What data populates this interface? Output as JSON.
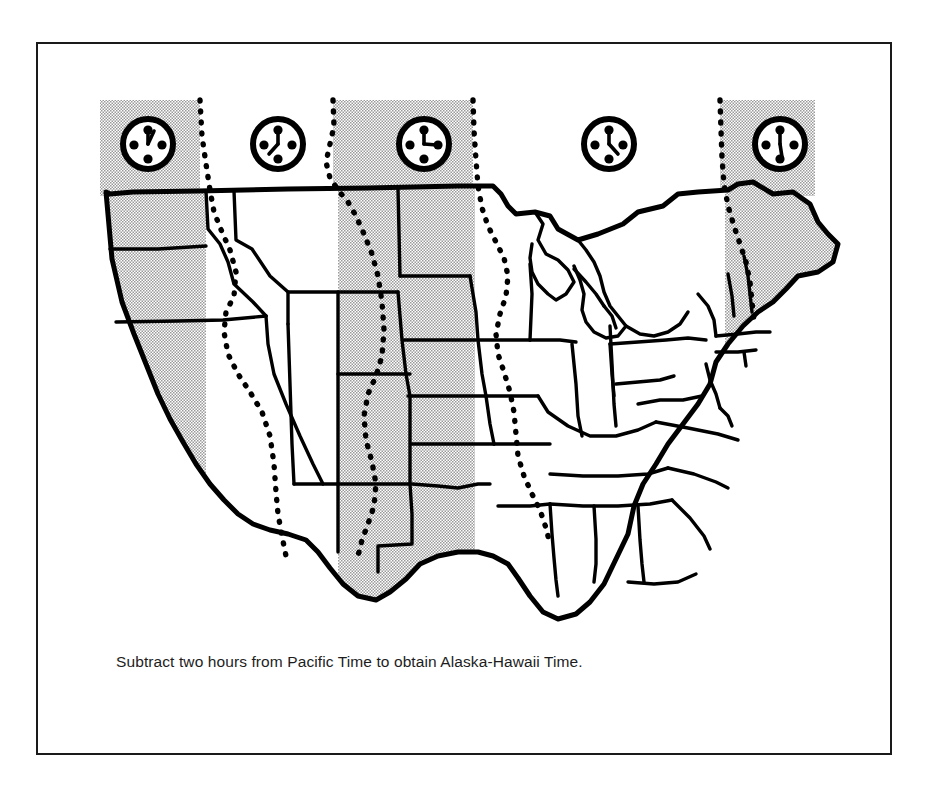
{
  "figure": {
    "kind": "us-time-zone-map",
    "caption": "Subtract two hours from Pacific Time to obtain Alaska-Hawaii Time.",
    "frame_border_color": "#1a1a1a",
    "background_color": "#ffffff",
    "ink_color": "#000000",
    "zone_shading_color": "#c9c9c9"
  },
  "zones": [
    {
      "id": "pacific",
      "name": "Pacific Time",
      "shaded": true,
      "clock": {
        "hour_angle": 0,
        "minute_angle": 20,
        "label": "pacific-clock"
      }
    },
    {
      "id": "mountain",
      "name": "Mountain Time",
      "shaded": false,
      "clock": {
        "hour_angle": 0,
        "minute_angle": 215,
        "label": "mountain-clock"
      }
    },
    {
      "id": "central",
      "name": "Central Time",
      "shaded": true,
      "clock": {
        "hour_angle": 0,
        "minute_angle": 95,
        "label": "central-clock"
      }
    },
    {
      "id": "eastern",
      "name": "Eastern Time",
      "shaded": false,
      "clock": {
        "hour_angle": 0,
        "minute_angle": 140,
        "label": "eastern-clock"
      }
    },
    {
      "id": "atlantic",
      "name": "Atlantic Time",
      "shaded": true,
      "clock": {
        "hour_angle": 0,
        "minute_angle": 178,
        "label": "atlantic-clock"
      }
    }
  ],
  "clock_positions": [
    {
      "zone": "pacific",
      "cx": 110,
      "cy": 100,
      "r": 25
    },
    {
      "zone": "mountain",
      "cx": 240,
      "cy": 100,
      "r": 25
    },
    {
      "zone": "central",
      "cx": 386,
      "cy": 100,
      "r": 25
    },
    {
      "zone": "eastern",
      "cx": 571,
      "cy": 100,
      "r": 25
    },
    {
      "zone": "atlantic",
      "cx": 742,
      "cy": 100,
      "r": 25
    }
  ],
  "zone_bands": [
    {
      "zone": "pacific",
      "x": 62,
      "width": 100,
      "shaded": true
    },
    {
      "zone": "mountain",
      "x": 162,
      "width": 133,
      "shaded": false
    },
    {
      "zone": "central",
      "x": 295,
      "width": 140,
      "shaded": true
    },
    {
      "zone": "eastern",
      "x": 435,
      "width": 247,
      "shaded": false
    },
    {
      "zone": "atlantic",
      "x": 682,
      "width": 95,
      "shaded": true
    }
  ],
  "band_top": 56,
  "band_bottom": 150
}
